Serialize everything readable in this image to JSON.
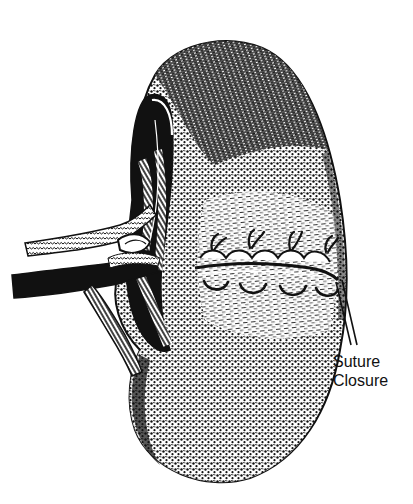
{
  "figure": {
    "style": "black-and-white pen-and-ink medical illustration",
    "colors": {
      "ink": "#111111",
      "paper": "#ffffff"
    }
  },
  "labels": {
    "suture_closure": {
      "line1": "Suture",
      "line2": "Closure"
    }
  },
  "parts": [
    "kidney-body",
    "renal-hilum",
    "renal-artery",
    "renal-vein",
    "ureter",
    "suture-line",
    "suture-stitches",
    "leader-lines"
  ]
}
